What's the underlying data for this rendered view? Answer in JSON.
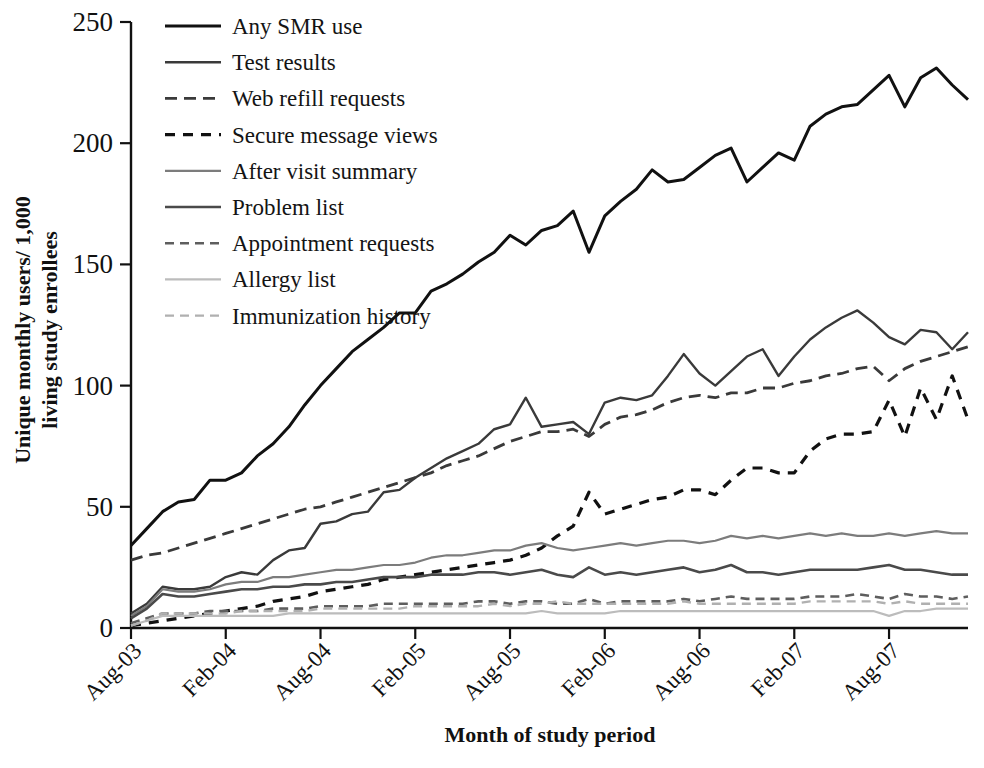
{
  "chart_data": {
    "type": "line",
    "title": "",
    "xlabel": "Month of study period",
    "ylabel": "Unique monthly users/ 1,000 living study enrollees",
    "ylim": [
      0,
      250
    ],
    "yticks": [
      0,
      50,
      100,
      150,
      200,
      250
    ],
    "xticks": [
      "Aug-03",
      "Feb-04",
      "Aug-04",
      "Feb-05",
      "Aug-05",
      "Feb-06",
      "Aug-06",
      "Feb-07",
      "Aug-07"
    ],
    "xtick_indices": [
      0,
      6,
      12,
      18,
      24,
      30,
      36,
      42,
      48
    ],
    "x_count": 54,
    "grid": false,
    "legend_position": "top-left",
    "series": [
      {
        "name": "Any SMR use",
        "color": "#111111",
        "width": 3.0,
        "dash": "none",
        "values": [
          34,
          41,
          48,
          52,
          53,
          61,
          61,
          64,
          71,
          76,
          83,
          92,
          100,
          107,
          114,
          119,
          124,
          130,
          130,
          139,
          142,
          146,
          151,
          155,
          162,
          158,
          164,
          166,
          172,
          155,
          170,
          176,
          181,
          189,
          184,
          185,
          190,
          195,
          198,
          184,
          190,
          196,
          193,
          207,
          212,
          215,
          216,
          222,
          228,
          215,
          227,
          231,
          224,
          218
        ]
      },
      {
        "name": "Test results",
        "color": "#3a3a3a",
        "width": 2.4,
        "dash": "none",
        "values": [
          6,
          10,
          17,
          16,
          16,
          17,
          21,
          23,
          22,
          28,
          32,
          33,
          43,
          44,
          47,
          48,
          56,
          57,
          62,
          66,
          70,
          73,
          76,
          82,
          84,
          95,
          83,
          84,
          85,
          80,
          93,
          95,
          94,
          96,
          104,
          113,
          105,
          100,
          106,
          112,
          115,
          104,
          112,
          119,
          124,
          128,
          131,
          126,
          120,
          117,
          123,
          122,
          115,
          122
        ]
      },
      {
        "name": "Web refill requests",
        "color": "#3a3a3a",
        "width": 2.8,
        "dash": "12,7",
        "values": [
          28,
          30,
          31,
          33,
          35,
          37,
          39,
          41,
          43,
          45,
          47,
          49,
          50,
          52,
          54,
          56,
          58,
          60,
          62,
          64,
          67,
          69,
          71,
          74,
          77,
          79,
          81,
          81,
          82,
          79,
          84,
          87,
          88,
          90,
          93,
          95,
          96,
          95,
          97,
          97,
          99,
          99,
          101,
          102,
          104,
          105,
          107,
          108,
          102,
          107,
          110,
          112,
          114,
          116
        ]
      },
      {
        "name": "Secure message views",
        "color": "#111111",
        "width": 3.2,
        "dash": "10,8",
        "values": [
          1,
          2,
          3,
          4,
          5,
          6,
          7,
          8,
          9,
          11,
          12,
          13,
          15,
          16,
          17,
          18,
          20,
          21,
          22,
          23,
          24,
          25,
          26,
          27,
          28,
          30,
          33,
          38,
          42,
          56,
          47,
          49,
          51,
          53,
          54,
          57,
          57,
          55,
          61,
          66,
          66,
          64,
          64,
          73,
          78,
          80,
          80,
          81,
          94,
          79,
          99,
          86,
          104,
          86
        ]
      },
      {
        "name": "After visit summary",
        "color": "#7c7c7c",
        "width": 2.2,
        "dash": "none",
        "values": [
          5,
          9,
          16,
          15,
          15,
          16,
          18,
          19,
          19,
          21,
          21,
          22,
          23,
          24,
          24,
          25,
          26,
          26,
          27,
          29,
          30,
          30,
          31,
          32,
          32,
          34,
          35,
          33,
          32,
          33,
          34,
          35,
          34,
          35,
          36,
          36,
          35,
          36,
          38,
          37,
          38,
          37,
          38,
          39,
          38,
          39,
          38,
          38,
          39,
          38,
          39,
          40,
          39,
          39
        ]
      },
      {
        "name": "Problem list",
        "color": "#4a4a4a",
        "width": 2.6,
        "dash": "none",
        "values": [
          4,
          8,
          14,
          13,
          13,
          14,
          15,
          16,
          16,
          17,
          17,
          18,
          18,
          19,
          19,
          20,
          21,
          21,
          21,
          22,
          22,
          22,
          23,
          23,
          22,
          23,
          24,
          22,
          21,
          25,
          22,
          23,
          22,
          23,
          24,
          25,
          23,
          24,
          26,
          23,
          23,
          22,
          23,
          24,
          24,
          24,
          24,
          25,
          26,
          24,
          24,
          23,
          22,
          22
        ]
      },
      {
        "name": "Appointment requests",
        "color": "#5e5e5e",
        "width": 2.6,
        "dash": "9,6",
        "values": [
          2,
          4,
          6,
          6,
          6,
          7,
          7,
          7,
          7,
          8,
          8,
          8,
          9,
          9,
          9,
          9,
          10,
          10,
          10,
          10,
          10,
          10,
          11,
          11,
          10,
          11,
          11,
          10,
          10,
          12,
          10,
          11,
          11,
          11,
          11,
          12,
          11,
          12,
          13,
          12,
          12,
          12,
          12,
          13,
          13,
          13,
          14,
          13,
          12,
          14,
          13,
          13,
          12,
          13
        ]
      },
      {
        "name": "Allergy list",
        "color": "#bcbcbc",
        "width": 2.2,
        "dash": "none",
        "values": [
          1,
          3,
          5,
          5,
          5,
          5,
          5,
          5,
          5,
          5,
          6,
          6,
          6,
          6,
          6,
          6,
          6,
          6,
          6,
          6,
          6,
          6,
          6,
          6,
          6,
          6,
          7,
          6,
          6,
          6,
          6,
          7,
          7,
          7,
          7,
          7,
          7,
          7,
          7,
          7,
          7,
          7,
          7,
          7,
          7,
          7,
          7,
          7,
          5,
          7,
          7,
          8,
          8,
          8
        ]
      },
      {
        "name": "Immunization history",
        "color": "#b0b0b0",
        "width": 2.4,
        "dash": "9,6",
        "values": [
          1,
          3,
          6,
          6,
          6,
          6,
          6,
          7,
          7,
          7,
          7,
          7,
          8,
          8,
          8,
          8,
          8,
          8,
          9,
          9,
          9,
          9,
          9,
          10,
          9,
          10,
          10,
          11,
          10,
          10,
          10,
          10,
          10,
          10,
          10,
          11,
          10,
          10,
          10,
          10,
          10,
          10,
          10,
          11,
          11,
          11,
          11,
          11,
          10,
          11,
          10,
          10,
          10,
          10
        ]
      }
    ]
  },
  "legend": {
    "items": [
      {
        "label": "Any SMR use"
      },
      {
        "label": "Test results"
      },
      {
        "label": "Web refill requests"
      },
      {
        "label": "Secure message views"
      },
      {
        "label": "After visit summary"
      },
      {
        "label": "Problem list"
      },
      {
        "label": "Appointment requests"
      },
      {
        "label": "Allergy list"
      },
      {
        "label": "Immunization history"
      }
    ]
  }
}
